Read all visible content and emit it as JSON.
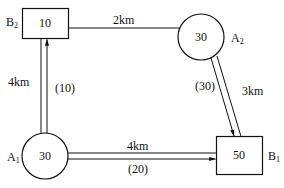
{
  "diagram": {
    "type": "transport-network",
    "nodes": [
      {
        "id": "B2",
        "shape": "rectangle",
        "label": "B",
        "subscript": "2",
        "value": "10"
      },
      {
        "id": "A2",
        "shape": "circle",
        "label": "A",
        "subscript": "2",
        "value": "30"
      },
      {
        "id": "A1",
        "shape": "circle",
        "label": "A",
        "subscript": "1",
        "value": "30"
      },
      {
        "id": "B1",
        "shape": "rectangle",
        "label": "B",
        "subscript": "1",
        "value": "50"
      }
    ],
    "edges": [
      {
        "from": "B2",
        "to": "A2",
        "distance": "2km",
        "flow": null
      },
      {
        "from": "A1",
        "to": "B2",
        "distance": "4km",
        "flow": "(10)"
      },
      {
        "from": "A2",
        "to": "B1",
        "distance": "3km",
        "flow": "(30)"
      },
      {
        "from": "A1",
        "to": "B1",
        "distance": "4km",
        "flow": "(20)"
      }
    ]
  },
  "colors": {
    "stroke": "#111111",
    "background": "#ffffff"
  }
}
